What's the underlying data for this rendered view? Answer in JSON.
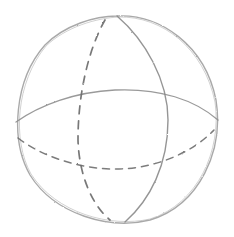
{
  "image": {
    "subject": "Pencil sketch of a wireframe sphere",
    "background": "#ffffff",
    "pencil_color": "#8a8a8a",
    "dashed_color": "#6e6e6e"
  },
  "sphere": {
    "outline": "solid circular outline",
    "equator_front": "solid",
    "equator_back": "dashed",
    "meridian_front": "solid",
    "meridian_back": "dashed"
  }
}
